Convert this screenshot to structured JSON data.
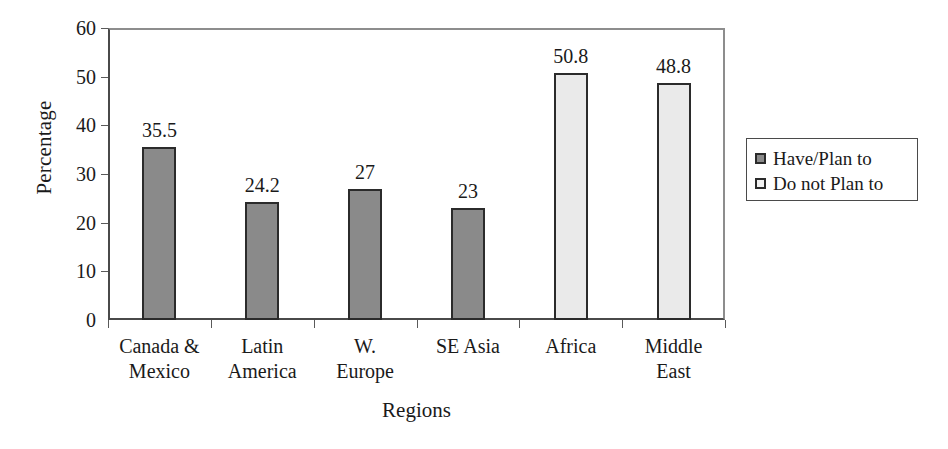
{
  "chart_data": {
    "type": "bar",
    "title": "",
    "xlabel": "Regions",
    "ylabel": "Percentage",
    "ylim": [
      0,
      60
    ],
    "ytick_step": 10,
    "yticks": [
      "60",
      "50",
      "40",
      "30",
      "20",
      "10",
      "0"
    ],
    "grid": false,
    "legend_position": "right",
    "categories": [
      "Canada &\nMexico",
      "Latin\nAmerica",
      "W.\nEurope",
      "SE Asia",
      "Africa",
      "Middle\nEast"
    ],
    "values": [
      35.5,
      24.2,
      27,
      23,
      50.8,
      48.8
    ],
    "value_labels": [
      "35.5",
      "24.2",
      "27",
      "23",
      "50.8",
      "48.8"
    ],
    "series_of_bar": [
      0,
      0,
      0,
      0,
      1,
      1
    ],
    "series": [
      {
        "name": "Have/Plan to",
        "color": "#8a8a8a"
      },
      {
        "name": "Do not Plan to",
        "color": "#eaeaea"
      }
    ],
    "legend": [
      {
        "label": "Have/Plan to",
        "color": "#8a8a8a"
      },
      {
        "label": "Do not Plan to",
        "color": "#f2f2f2"
      }
    ],
    "bar_border_color": "#2b2b2b",
    "axis_color": "#4a4a4a",
    "background": "#ffffff"
  }
}
